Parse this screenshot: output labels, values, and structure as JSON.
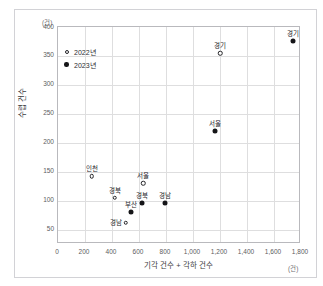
{
  "title": "",
  "frame": {},
  "chart_data": {
    "type": "scatter",
    "title": "",
    "xlabel": "기각 건수 + 각하 건수",
    "ylabel": "수렵 건수",
    "x_unit": "(건)",
    "y_unit": "(건)",
    "grid": true,
    "legend_position": "top-left",
    "xlim": [
      0,
      1800
    ],
    "ylim": [
      25,
      400
    ],
    "xticks": [
      "0",
      "200",
      "400",
      "600",
      "800",
      "1,000",
      "1,200",
      "1,400",
      "1,600",
      "1,800"
    ],
    "xtick_values": [
      0,
      200,
      400,
      600,
      800,
      1000,
      1200,
      1400,
      1600,
      1800
    ],
    "yticks": [
      "400",
      "350",
      "300",
      "250",
      "200",
      "150",
      "100",
      "50"
    ],
    "ytick_values": [
      400,
      350,
      300,
      250,
      200,
      150,
      100,
      50
    ],
    "series": [
      {
        "name": "2022년",
        "marker": "open-circle",
        "points": [
          {
            "label": "인천",
            "x": 250,
            "y": 142,
            "label_pos": "above"
          },
          {
            "label": "경북",
            "x": 420,
            "y": 105,
            "label_pos": "above"
          },
          {
            "label": "경남",
            "x": 500,
            "y": 62,
            "label_pos": "left"
          },
          {
            "label": "서울",
            "x": 630,
            "y": 130,
            "label_pos": "above"
          },
          {
            "label": "경기",
            "x": 1200,
            "y": 355,
            "label_pos": "above"
          }
        ]
      },
      {
        "name": "2023년",
        "marker": "filled-circle",
        "points": [
          {
            "label": "부산",
            "x": 540,
            "y": 80,
            "label_pos": "above"
          },
          {
            "label": "경북",
            "x": 620,
            "y": 95,
            "label_pos": "above"
          },
          {
            "label": "경남",
            "x": 790,
            "y": 95,
            "label_pos": "above"
          },
          {
            "label": "서울",
            "x": 1160,
            "y": 220,
            "label_pos": "above"
          },
          {
            "label": "경기",
            "x": 1740,
            "y": 375,
            "label_pos": "above"
          }
        ]
      }
    ]
  }
}
